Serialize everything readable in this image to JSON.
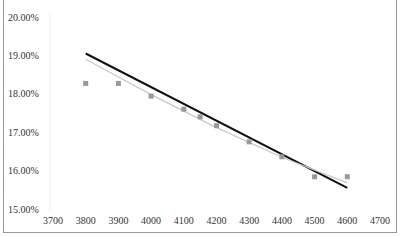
{
  "chart_data": {
    "type": "scatter",
    "title": "",
    "xlabel": "",
    "ylabel": "",
    "xlim": [
      3700,
      4700
    ],
    "ylim": [
      0.15,
      0.2
    ],
    "x_ticks": [
      "3700",
      "3800",
      "3900",
      "4000",
      "4100",
      "4200",
      "4300",
      "4400",
      "4500",
      "4600",
      "4700"
    ],
    "y_ticks": [
      "15.00%",
      "16.00%",
      "17.00%",
      "18.00%",
      "19.00%",
      "20.00%"
    ],
    "grid": false,
    "legend": null,
    "series": [
      {
        "name": "data points",
        "type": "scatter",
        "marker": "square",
        "color": "#999999",
        "x": [
          3800,
          3900,
          4000,
          4100,
          4150,
          4200,
          4300,
          4400,
          4500,
          4600
        ],
        "y": [
          0.1827,
          0.1827,
          0.1794,
          0.176,
          0.174,
          0.1717,
          0.1675,
          0.1636,
          0.1584,
          0.1584
        ]
      },
      {
        "name": "fit line (black)",
        "type": "line",
        "color": "#111111",
        "x": [
          3800,
          4600
        ],
        "y": [
          0.1905,
          0.1555
        ]
      },
      {
        "name": "trendline (gray)",
        "type": "line",
        "color": "#c8c8c8",
        "x": [
          3800,
          4000,
          4200,
          4400,
          4600
        ],
        "y": [
          0.189,
          0.1798,
          0.1712,
          0.1635,
          0.1568
        ]
      }
    ]
  }
}
